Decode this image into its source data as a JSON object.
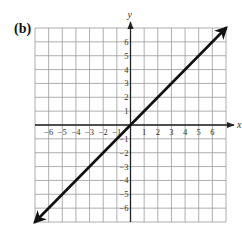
{
  "panel_label": "(b)",
  "chart_data": {
    "type": "line",
    "title": "",
    "panel_label": "(b)",
    "xlabel": "x",
    "ylabel": "y",
    "xlim": [
      -7,
      7
    ],
    "ylim": [
      -7,
      7
    ],
    "grid": true,
    "grid_step": 1,
    "x_ticks": [
      -6,
      -5,
      -4,
      -3,
      -2,
      -1,
      1,
      2,
      3,
      4,
      5,
      6
    ],
    "y_ticks": [
      -6,
      -5,
      -4,
      -3,
      -2,
      -1,
      1,
      2,
      3,
      4,
      5,
      6
    ],
    "x_tick_labels": [
      "−6",
      "−5",
      "−4",
      "−3",
      "−2",
      "−1",
      "1",
      "2",
      "3",
      "4",
      "5",
      "6"
    ],
    "y_tick_labels": [
      "−6",
      "−5",
      "−4",
      "−3",
      "−2",
      "−1",
      "1",
      "2",
      "3",
      "4",
      "5",
      "6"
    ],
    "legend": null,
    "series": [
      {
        "name": "y = x",
        "x": [
          -7,
          7
        ],
        "y": [
          -7,
          7
        ],
        "arrows_both_ends": true,
        "color": "#111111"
      }
    ]
  },
  "colors": {
    "grid": "#9a9a9a",
    "axis": "#222222",
    "line": "#111111",
    "text": "#333333"
  }
}
